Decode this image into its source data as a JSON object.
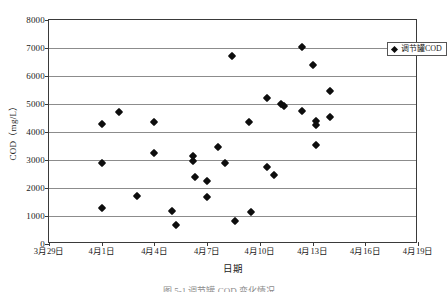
{
  "chart_data": {
    "type": "scatter",
    "title": "",
    "xlabel": "日期",
    "ylabel": "COD（mg/L）",
    "ylim": [
      0,
      8000
    ],
    "ytick_labels": [
      "8000",
      "7000",
      "6000",
      "5000",
      "4000",
      "3000",
      "2000",
      "1000",
      "0"
    ],
    "ytick_values": [
      8000,
      7000,
      6000,
      5000,
      4000,
      3000,
      2000,
      1000,
      0
    ],
    "xtick_labels": [
      "3月29日",
      "4月1日",
      "4月4日",
      "4月7日",
      "4月10日",
      "4月13日",
      "4月16日",
      "4月19日"
    ],
    "xtick_values": [
      0,
      3,
      6,
      9,
      12,
      15,
      18,
      21
    ],
    "xlim": [
      0,
      21
    ],
    "grid": "horizontal",
    "legend_position": "top-right",
    "marker": "diamond",
    "marker_color": "#0d0d0d",
    "series": [
      {
        "name": "调节罐COD",
        "points": [
          {
            "x": 3.0,
            "y": 4270
          },
          {
            "x": 3.0,
            "y": 2880
          },
          {
            "x": 3.0,
            "y": 1280
          },
          {
            "x": 4.0,
            "y": 4720
          },
          {
            "x": 5.0,
            "y": 1700
          },
          {
            "x": 6.0,
            "y": 4350
          },
          {
            "x": 6.0,
            "y": 3250
          },
          {
            "x": 7.0,
            "y": 1180
          },
          {
            "x": 7.2,
            "y": 690
          },
          {
            "x": 8.2,
            "y": 3150
          },
          {
            "x": 8.2,
            "y": 2960
          },
          {
            "x": 8.3,
            "y": 2400
          },
          {
            "x": 9.0,
            "y": 2250
          },
          {
            "x": 9.0,
            "y": 1680
          },
          {
            "x": 9.6,
            "y": 3450
          },
          {
            "x": 10.0,
            "y": 2880
          },
          {
            "x": 10.4,
            "y": 6700
          },
          {
            "x": 10.6,
            "y": 830
          },
          {
            "x": 11.4,
            "y": 4350
          },
          {
            "x": 11.5,
            "y": 1130
          },
          {
            "x": 12.4,
            "y": 5200
          },
          {
            "x": 12.4,
            "y": 2740
          },
          {
            "x": 12.8,
            "y": 2450
          },
          {
            "x": 13.2,
            "y": 5000
          },
          {
            "x": 13.4,
            "y": 4930
          },
          {
            "x": 14.4,
            "y": 7050
          },
          {
            "x": 14.4,
            "y": 4750
          },
          {
            "x": 15.0,
            "y": 6380
          },
          {
            "x": 15.2,
            "y": 4400
          },
          {
            "x": 15.2,
            "y": 4250
          },
          {
            "x": 15.2,
            "y": 3520
          },
          {
            "x": 16.0,
            "y": 4550
          },
          {
            "x": 16.0,
            "y": 5450
          }
        ]
      }
    ]
  },
  "legend": {
    "label": "调节罐COD"
  },
  "caption": {
    "text": "图 5-1  调节罐 COD 变化情况"
  }
}
